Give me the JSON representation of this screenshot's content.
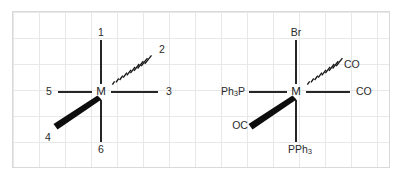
{
  "figure": {
    "background_color": "#ffffff",
    "grid_color": "#e8e8e8",
    "border_color": "#d9d9d9",
    "line_color": "#262626",
    "wedge_color": "#0d0d0d",
    "text_color": "#2b2b2b"
  },
  "diagrams": [
    {
      "name": "generic-octahedron",
      "center_label": "M",
      "ligands": {
        "top": "1",
        "hashed_upper_right": "2",
        "right": "3",
        "wedge_lower_left": "4",
        "left": "5",
        "bottom": "6"
      }
    },
    {
      "name": "assigned-octahedron",
      "center_label": "M",
      "ligands": {
        "top": "Br",
        "hashed_upper_right": "CO",
        "right": "CO",
        "wedge_lower_left": "OC",
        "left": "Ph3P",
        "bottom": "PPh3"
      },
      "ligand_parts": {
        "left_main": "Ph",
        "left_sub": "3",
        "left_tail": "P",
        "bottom_main": "PPh",
        "bottom_sub": "3"
      }
    }
  ],
  "bond_types": {
    "plain": "in-plane bond",
    "hashed": "bond going back behind the plane",
    "wedge": "bond coming forward out of the plane"
  }
}
